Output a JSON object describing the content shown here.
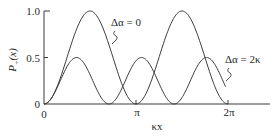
{
  "chart_data": {
    "type": "line",
    "title": "",
    "xlabel": "κx",
    "ylabel": "P+(x)",
    "ylabel_main": "P",
    "ylabel_sub": "+",
    "ylabel_arg": "(x)",
    "xlim": [
      0,
      6.6
    ],
    "ylim": [
      0,
      1.0
    ],
    "grid": false,
    "legend_position": "inline annotations",
    "x_ticks": [
      {
        "value": 0,
        "label": "0"
      },
      {
        "value": 3.14159,
        "label": "π"
      },
      {
        "value": 6.28319,
        "label": "2π"
      }
    ],
    "y_ticks": [
      {
        "value": 0,
        "label": "0"
      },
      {
        "value": 0.5,
        "label": "0.5"
      },
      {
        "value": 1.0,
        "label": "1.0"
      }
    ],
    "series": [
      {
        "name": "Δα = 0",
        "formula": "sin^2(κx)",
        "x": [
          0,
          0.39,
          0.79,
          1.18,
          1.57,
          1.96,
          2.36,
          2.75,
          3.14,
          3.53,
          3.93,
          4.32,
          4.71,
          5.11,
          5.5,
          5.89,
          6.28
        ],
        "values": [
          0,
          0.15,
          0.5,
          0.85,
          1.0,
          0.85,
          0.5,
          0.15,
          0,
          0.15,
          0.5,
          0.85,
          1.0,
          0.85,
          0.5,
          0.15,
          0
        ],
        "x_end": 6.28
      },
      {
        "name": "Δα = 2κ",
        "formula": "0.5·sin^2(√2·κx)",
        "x": [
          0,
          0.28,
          0.56,
          0.83,
          1.11,
          1.39,
          1.67,
          1.94,
          2.22,
          2.5,
          2.78,
          3.05,
          3.33,
          3.61,
          3.89,
          4.16,
          4.44,
          4.72,
          5.0,
          5.27,
          5.55,
          5.83,
          6.11
        ],
        "values": [
          0,
          0.07,
          0.25,
          0.43,
          0.5,
          0.43,
          0.25,
          0.07,
          0,
          0.07,
          0.25,
          0.43,
          0.5,
          0.43,
          0.25,
          0.07,
          0,
          0.07,
          0.25,
          0.43,
          0.5,
          0.43,
          0.25
        ],
        "x_end": 6.2
      }
    ],
    "annotations": [
      {
        "text": "Δα = 0",
        "series": "Δα = 0"
      },
      {
        "text": "Δα = 2κ",
        "series": "Δα = 2κ"
      }
    ]
  }
}
